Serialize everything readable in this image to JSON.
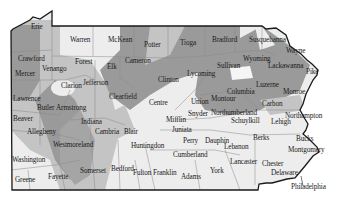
{
  "map": {
    "title": "Pennsylvania Counties",
    "colors": {
      "dark": "#9a9a9a",
      "medium": "#c4c4c4",
      "light": "#ededed",
      "border": "#1a1a1a",
      "county_line": "#8a8a8a"
    },
    "counties": [
      {
        "name": "Erie",
        "x": 31,
        "y": 28
      },
      {
        "name": "Warren",
        "x": 70,
        "y": 41
      },
      {
        "name": "McKean",
        "x": 108,
        "y": 41
      },
      {
        "name": "Potter",
        "x": 144,
        "y": 46
      },
      {
        "name": "Tioga",
        "x": 180,
        "y": 44
      },
      {
        "name": "Bradford",
        "x": 212,
        "y": 41
      },
      {
        "name": "Susquehanna",
        "x": 249,
        "y": 41
      },
      {
        "name": "Wayne",
        "x": 286,
        "y": 52
      },
      {
        "name": "Crawford",
        "x": 18,
        "y": 60
      },
      {
        "name": "Forest",
        "x": 75,
        "y": 63
      },
      {
        "name": "Elk",
        "x": 107,
        "y": 68
      },
      {
        "name": "Cameron",
        "x": 125,
        "y": 62
      },
      {
        "name": "Sullivan",
        "x": 217,
        "y": 67
      },
      {
        "name": "Wyoming",
        "x": 243,
        "y": 60
      },
      {
        "name": "Lackawanna",
        "x": 268,
        "y": 67
      },
      {
        "name": "Pike",
        "x": 306,
        "y": 73
      },
      {
        "name": "Mercer",
        "x": 15,
        "y": 75
      },
      {
        "name": "Venango",
        "x": 42,
        "y": 70
      },
      {
        "name": "Jefferson",
        "x": 83,
        "y": 84
      },
      {
        "name": "Clarion",
        "x": 61,
        "y": 87
      },
      {
        "name": "Clinton",
        "x": 158,
        "y": 81
      },
      {
        "name": "Lycoming",
        "x": 187,
        "y": 75
      },
      {
        "name": "Luzerne",
        "x": 256,
        "y": 86
      },
      {
        "name": "Columbia",
        "x": 227,
        "y": 93
      },
      {
        "name": "Montour",
        "x": 211,
        "y": 100
      },
      {
        "name": "Monroe",
        "x": 283,
        "y": 93
      },
      {
        "name": "Lawrence",
        "x": 13,
        "y": 100
      },
      {
        "name": "Butler",
        "x": 37,
        "y": 109
      },
      {
        "name": "Armstrong",
        "x": 56,
        "y": 109
      },
      {
        "name": "Clearfield",
        "x": 109,
        "y": 98
      },
      {
        "name": "Centre",
        "x": 149,
        "y": 104
      },
      {
        "name": "Union",
        "x": 191,
        "y": 103
      },
      {
        "name": "Carbon",
        "x": 262,
        "y": 105
      },
      {
        "name": "Beaver",
        "x": 13,
        "y": 120
      },
      {
        "name": "Indiana",
        "x": 81,
        "y": 123
      },
      {
        "name": "Snyder",
        "x": 188,
        "y": 115
      },
      {
        "name": "Northumberland",
        "x": 211,
        "y": 114
      },
      {
        "name": "Northampton",
        "x": 285,
        "y": 117
      },
      {
        "name": "Mifflin",
        "x": 166,
        "y": 121
      },
      {
        "name": "Schuylkill",
        "x": 231,
        "y": 122
      },
      {
        "name": "Lehigh",
        "x": 271,
        "y": 123
      },
      {
        "name": "Allegheny",
        "x": 27,
        "y": 133
      },
      {
        "name": "Cambria",
        "x": 95,
        "y": 133
      },
      {
        "name": "Blair",
        "x": 124,
        "y": 133
      },
      {
        "name": "Juniata",
        "x": 172,
        "y": 131
      },
      {
        "name": "Berks",
        "x": 253,
        "y": 139
      },
      {
        "name": "Bucks",
        "x": 296,
        "y": 140
      },
      {
        "name": "Westmoreland",
        "x": 53,
        "y": 146
      },
      {
        "name": "Huntingdon",
        "x": 131,
        "y": 147
      },
      {
        "name": "Perry",
        "x": 183,
        "y": 142
      },
      {
        "name": "Dauphin",
        "x": 205,
        "y": 142
      },
      {
        "name": "Lebanon",
        "x": 224,
        "y": 148
      },
      {
        "name": "Montgomery",
        "x": 288,
        "y": 151
      },
      {
        "name": "Washington",
        "x": 12,
        "y": 161
      },
      {
        "name": "Cumberland",
        "x": 173,
        "y": 156
      },
      {
        "name": "Lancaster",
        "x": 230,
        "y": 163
      },
      {
        "name": "Chester",
        "x": 262,
        "y": 165
      },
      {
        "name": "Greene",
        "x": 15,
        "y": 181
      },
      {
        "name": "Fayette",
        "x": 48,
        "y": 178
      },
      {
        "name": "Somerset",
        "x": 80,
        "y": 172
      },
      {
        "name": "Bedford",
        "x": 111,
        "y": 170
      },
      {
        "name": "Fulton",
        "x": 133,
        "y": 174
      },
      {
        "name": "Franklin",
        "x": 153,
        "y": 174
      },
      {
        "name": "Adams",
        "x": 181,
        "y": 178
      },
      {
        "name": "York",
        "x": 210,
        "y": 172
      },
      {
        "name": "Delaware",
        "x": 271,
        "y": 174
      },
      {
        "name": "Philadelphia",
        "x": 291,
        "y": 188
      }
    ]
  }
}
